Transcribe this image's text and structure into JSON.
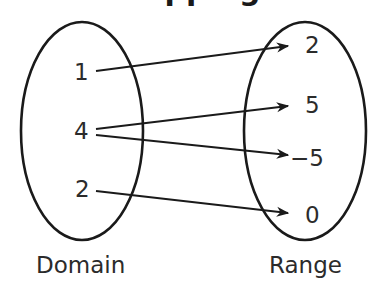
{
  "title": "Mapping",
  "domain": {
    "label": "Domain",
    "values": [
      "1",
      "4",
      "2"
    ]
  },
  "range": {
    "label": "Range",
    "values": [
      "2",
      "5",
      "−5",
      "0"
    ]
  },
  "mappings": [
    {
      "from": "1",
      "to": "2"
    },
    {
      "from": "4",
      "to": "5"
    },
    {
      "from": "4",
      "to": "−5"
    },
    {
      "from": "2",
      "to": "0"
    }
  ],
  "colors": {
    "stroke": "#1a1a1a",
    "text": "#2b2b2b",
    "background": "#ffffff"
  }
}
